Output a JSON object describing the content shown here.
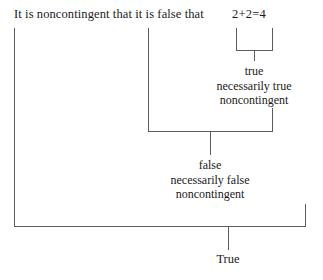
{
  "diagram": {
    "type": "truth-value-tree",
    "sentence": {
      "prefix_text": "It is noncontingent that it is false that",
      "atom_text": "2+2=4"
    },
    "nodes": [
      {
        "id": "inner",
        "lines": [
          "true",
          "necessarily true",
          "noncontingent"
        ],
        "line1": "true",
        "line2": "necessarily true",
        "line3": "noncontingent"
      },
      {
        "id": "middle",
        "lines": [
          "false",
          "necessarily false",
          "noncontingent"
        ],
        "line1": "false",
        "line2": "necessarily false",
        "line3": "noncontingent"
      }
    ],
    "root_value": "True",
    "colors": {
      "line": "#5c5c5c",
      "text": "#1a1a1a",
      "background": "#ffffff"
    }
  }
}
